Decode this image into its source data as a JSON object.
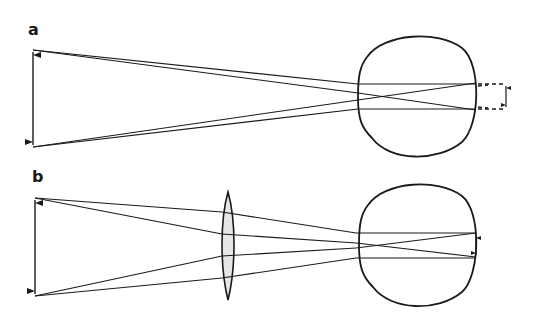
{
  "figure": {
    "panels": [
      {
        "label": "a",
        "description": "Myopic eye: image of object focuses in front of retina; virtual image beyond retina shown dashed"
      },
      {
        "label": "b",
        "description": "Corrected with converging lens in front of eye; image focuses on retina"
      }
    ],
    "colors": {
      "stroke": "#1a1a1a",
      "lens_fill": "#e6e6e6",
      "background": "#ffffff"
    }
  }
}
